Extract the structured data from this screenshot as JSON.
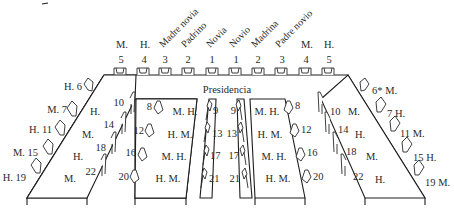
{
  "diagram": {
    "title": "Presidencia",
    "head_table": {
      "label": "Presidencia",
      "left_seats": [
        {
          "number": "5",
          "role": "M."
        },
        {
          "number": "4",
          "role": "H."
        },
        {
          "number": "3",
          "role": "Madre novia"
        },
        {
          "number": "2",
          "role": "Padrino"
        },
        {
          "number": "1",
          "role": "Novia"
        }
      ],
      "right_seats": [
        {
          "number": "1",
          "role": "Novio"
        },
        {
          "number": "2",
          "role": "Madrina"
        },
        {
          "number": "3",
          "role": "Padre novio"
        },
        {
          "number": "4",
          "role": "M."
        },
        {
          "number": "5",
          "role": "H."
        }
      ]
    },
    "left_outer_seats": [
      {
        "label": "H. 6"
      },
      {
        "label": "M. 7"
      },
      {
        "label": "H. 11"
      },
      {
        "label": "M. 15"
      },
      {
        "label": "H. 19"
      }
    ],
    "right_outer_seats": [
      {
        "label": "6* M."
      },
      {
        "label": "7 H."
      },
      {
        "label": "11 M."
      },
      {
        "label": "15 H."
      },
      {
        "label": "19 M."
      }
    ],
    "table1_inner": [
      "H.",
      "M.",
      "H.",
      "M."
    ],
    "table1_right_seats": [
      "10",
      "14",
      "18",
      "22"
    ],
    "table2_left_seats": [
      "8",
      "12",
      "16",
      "20"
    ],
    "table2_inner": [
      "M. H.",
      "H. M.",
      "M. H.",
      "H. M."
    ],
    "table2_right_seats": [
      "9",
      "13",
      "17",
      "21"
    ],
    "table3_left_seats": [
      "9",
      "13",
      "17",
      "21"
    ],
    "table3_inner": [
      "M. H.",
      "H. M.",
      "M. H.",
      "H. M."
    ],
    "table3_right_seats": [
      "8",
      "12",
      "16",
      "20"
    ],
    "table4_left_seats": [
      "10",
      "14",
      "18",
      "22"
    ],
    "table4_inner": [
      "M.",
      "H.",
      "M.",
      "H."
    ]
  }
}
